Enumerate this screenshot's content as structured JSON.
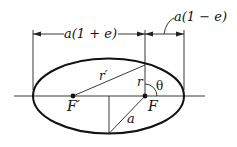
{
  "diagram": {
    "dimension_labels": {
      "left": "a(1 + e)",
      "right": "a(1 − e)"
    },
    "points": {
      "focus_left": "F′",
      "focus_right": "F"
    },
    "segments": {
      "r_prime": "r′",
      "r": "r",
      "a": "a"
    },
    "angle": "θ"
  }
}
